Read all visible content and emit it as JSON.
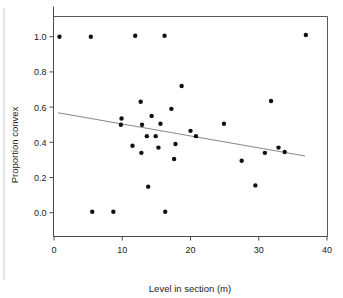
{
  "chart_data": {
    "type": "scatter",
    "title": "",
    "xlabel": "Level in section (m)",
    "ylabel": "Proportion convex",
    "xlim": [
      0,
      40
    ],
    "ylim": [
      0.0,
      1.0
    ],
    "xticks": [
      0,
      10,
      20,
      30,
      40
    ],
    "xtick_labels": [
      "0",
      "10",
      "20",
      "30",
      "40"
    ],
    "yticks": [
      0.0,
      0.2,
      0.4,
      0.6,
      0.8,
      1.0
    ],
    "ytick_labels": [
      "0.0",
      "0.2",
      "0.4",
      "0.6",
      "0.8",
      "1.0"
    ],
    "grid": false,
    "legend": false,
    "marker": "filled-circle",
    "marker_color": "#111111",
    "points": [
      {
        "x": 0.8,
        "y": 1.0
      },
      {
        "x": 5.4,
        "y": 1.0
      },
      {
        "x": 11.9,
        "y": 1.005
      },
      {
        "x": 16.2,
        "y": 1.005
      },
      {
        "x": 36.9,
        "y": 1.01
      },
      {
        "x": 18.7,
        "y": 0.72
      },
      {
        "x": 31.8,
        "y": 0.635
      },
      {
        "x": 12.7,
        "y": 0.63
      },
      {
        "x": 17.2,
        "y": 0.59
      },
      {
        "x": 14.3,
        "y": 0.55
      },
      {
        "x": 9.9,
        "y": 0.535
      },
      {
        "x": 9.8,
        "y": 0.5
      },
      {
        "x": 12.9,
        "y": 0.5
      },
      {
        "x": 15.6,
        "y": 0.505
      },
      {
        "x": 24.9,
        "y": 0.505
      },
      {
        "x": 20.0,
        "y": 0.465
      },
      {
        "x": 13.6,
        "y": 0.435
      },
      {
        "x": 14.9,
        "y": 0.435
      },
      {
        "x": 20.8,
        "y": 0.435
      },
      {
        "x": 17.8,
        "y": 0.39
      },
      {
        "x": 11.5,
        "y": 0.38
      },
      {
        "x": 32.9,
        "y": 0.37
      },
      {
        "x": 15.3,
        "y": 0.37
      },
      {
        "x": 30.9,
        "y": 0.34
      },
      {
        "x": 33.8,
        "y": 0.345
      },
      {
        "x": 12.8,
        "y": 0.34
      },
      {
        "x": 17.6,
        "y": 0.305
      },
      {
        "x": 27.5,
        "y": 0.295
      },
      {
        "x": 29.5,
        "y": 0.155
      },
      {
        "x": 13.8,
        "y": 0.148
      },
      {
        "x": 5.6,
        "y": 0.005
      },
      {
        "x": 8.7,
        "y": 0.005
      },
      {
        "x": 16.3,
        "y": 0.005
      }
    ],
    "fit_line": {
      "name": "regression-line",
      "color": "#8a8a8a",
      "x_start": 0.6,
      "y_start": 0.568,
      "x_end": 36.8,
      "y_end": 0.322
    }
  }
}
